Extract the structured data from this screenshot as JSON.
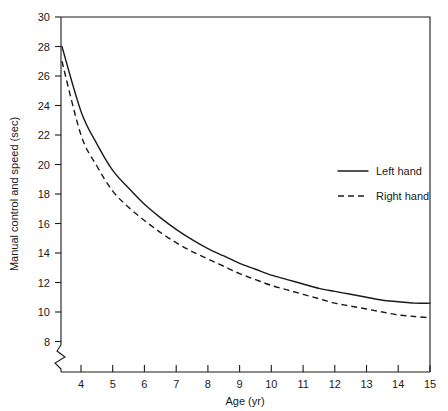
{
  "chart_data": {
    "type": "line",
    "title": "",
    "xlabel": "Age (yr)",
    "ylabel": "Manual control and speed (sec)",
    "xlim": [
      3.3,
      15
    ],
    "ylim": [
      7.4,
      30
    ],
    "xticks": [
      4,
      5,
      6,
      7,
      8,
      9,
      10,
      11,
      12,
      13,
      14,
      15
    ],
    "yticks": [
      8,
      10,
      12,
      14,
      16,
      18,
      20,
      22,
      24,
      26,
      28,
      30
    ],
    "grid": false,
    "y_axis_break": true,
    "legend_position": "right-middle",
    "x": [
      3.4,
      4,
      4.5,
      5,
      5.5,
      6,
      6.5,
      7,
      7.5,
      8,
      8.5,
      9,
      9.5,
      10,
      10.5,
      11,
      11.5,
      12,
      12.5,
      13,
      13.5,
      14,
      14.5,
      15
    ],
    "series": [
      {
        "name": "Left hand",
        "style": "solid",
        "values": [
          28.0,
          23.6,
          21.4,
          19.6,
          18.4,
          17.3,
          16.4,
          15.6,
          14.9,
          14.3,
          13.8,
          13.3,
          12.9,
          12.5,
          12.2,
          11.9,
          11.6,
          11.4,
          11.2,
          11.0,
          10.8,
          10.7,
          10.6,
          10.6
        ]
      },
      {
        "name": "Right hand",
        "style": "dashed",
        "values": [
          27.0,
          22.0,
          19.9,
          18.2,
          17.1,
          16.2,
          15.4,
          14.7,
          14.1,
          13.6,
          13.1,
          12.6,
          12.2,
          11.8,
          11.5,
          11.2,
          10.9,
          10.6,
          10.4,
          10.2,
          10.0,
          9.8,
          9.7,
          9.6
        ]
      }
    ],
    "xtick_labels": [
      "4",
      "5",
      "6",
      "7",
      "8",
      "9",
      "10",
      "11",
      "12",
      "13",
      "14",
      "15"
    ],
    "ytick_labels": [
      "8",
      "10",
      "12",
      "14",
      "16",
      "18",
      "20",
      "22",
      "24",
      "26",
      "28",
      "30"
    ]
  },
  "legend": {
    "items": [
      {
        "label": "Left hand",
        "style": "solid"
      },
      {
        "label": "Right hand",
        "style": "dashed"
      }
    ]
  },
  "axes": {
    "x_title": "Age (yr)",
    "y_title": "Manual control and speed (sec)"
  }
}
